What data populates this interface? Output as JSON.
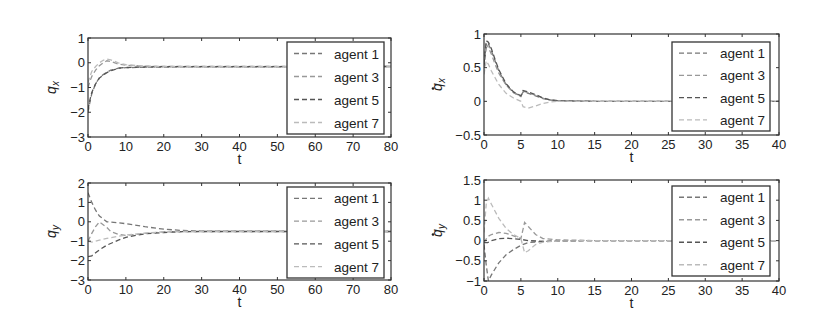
{
  "figure": {
    "background": "#ffffff",
    "axes_color": "#333333"
  },
  "chart_data": [
    {
      "id": "qx",
      "type": "line",
      "title": "",
      "xlabel": "t",
      "ylabel": "q_x",
      "ylabel_main": "q",
      "ylabel_sub": "x",
      "ylabel_dot": false,
      "xlim": [
        0,
        80
      ],
      "ylim": [
        -3,
        1
      ],
      "xticks": [
        0,
        10,
        20,
        30,
        40,
        50,
        60,
        70,
        80
      ],
      "yticks": [
        -3,
        -2,
        -1,
        0,
        1
      ],
      "grid": false,
      "legend_position": "upper right",
      "box": {
        "left": 88,
        "top": 38,
        "right": 391,
        "bottom": 137
      },
      "legend_box": {
        "left": 287,
        "top": 42,
        "right": 384,
        "bottom": 134
      },
      "series": [
        {
          "name": "agent 1",
          "color": "#777777",
          "x": [
            0,
            0.5,
            1,
            2,
            3,
            4,
            5,
            6,
            8,
            10,
            15,
            20,
            80
          ],
          "y": [
            -2.0,
            -1.6,
            -1.25,
            -0.85,
            -0.6,
            -0.48,
            -0.38,
            -0.3,
            -0.22,
            -0.2,
            -0.18,
            -0.17,
            -0.15
          ]
        },
        {
          "name": "agent 3",
          "color": "#999999",
          "x": [
            0,
            0.5,
            1,
            2,
            3,
            4,
            5,
            6,
            8,
            10,
            15,
            20,
            80
          ],
          "y": [
            -1.0,
            -0.75,
            -0.55,
            -0.3,
            -0.12,
            0.0,
            0.08,
            0.05,
            -0.05,
            -0.1,
            -0.14,
            -0.15,
            -0.15
          ]
        },
        {
          "name": "agent 5",
          "color": "#555555",
          "x": [
            0,
            0.5,
            1,
            2,
            3,
            4,
            5,
            6,
            8,
            10,
            15,
            20,
            80
          ],
          "y": [
            -1.9,
            -1.5,
            -1.2,
            -0.85,
            -0.62,
            -0.5,
            -0.4,
            -0.33,
            -0.22,
            -0.19,
            -0.17,
            -0.16,
            -0.15
          ]
        },
        {
          "name": "agent 7",
          "color": "#bbbbbb",
          "x": [
            0,
            0.5,
            1,
            2,
            3,
            4,
            5,
            6,
            8,
            10,
            15,
            20,
            80
          ],
          "y": [
            -0.8,
            -0.55,
            -0.35,
            -0.15,
            0.0,
            0.1,
            0.15,
            0.12,
            0.0,
            -0.08,
            -0.13,
            -0.15,
            -0.15
          ]
        }
      ]
    },
    {
      "id": "qx_dot",
      "type": "line",
      "title": "",
      "xlabel": "t",
      "ylabel": "q̇_x",
      "ylabel_main": "q",
      "ylabel_sub": "x",
      "ylabel_dot": true,
      "xlim": [
        0,
        40
      ],
      "ylim": [
        -0.5,
        1
      ],
      "xticks": [
        0,
        5,
        10,
        15,
        20,
        25,
        30,
        35,
        40
      ],
      "yticks": [
        -0.5,
        0,
        0.5,
        1
      ],
      "grid": false,
      "legend_position": "upper right",
      "box": {
        "left": 484,
        "top": 34,
        "right": 779,
        "bottom": 135
      },
      "legend_box": {
        "left": 672,
        "top": 42,
        "right": 770,
        "bottom": 131
      },
      "series": [
        {
          "name": "agent 1",
          "color": "#777777",
          "x": [
            0,
            0.3,
            0.6,
            1,
            1.5,
            2,
            3,
            4,
            5,
            5.3,
            6,
            7,
            8,
            9,
            10,
            12,
            15,
            40
          ],
          "y": [
            0.5,
            0.8,
            0.85,
            0.75,
            0.6,
            0.45,
            0.25,
            0.13,
            0.08,
            0.14,
            0.12,
            0.08,
            0.04,
            0.02,
            0.01,
            0.005,
            0.0,
            0.0
          ]
        },
        {
          "name": "agent 3",
          "color": "#999999",
          "x": [
            0,
            0.3,
            0.6,
            1,
            1.5,
            2,
            3,
            4,
            5,
            5.3,
            6,
            7,
            8,
            9,
            10,
            12,
            15,
            40
          ],
          "y": [
            0.6,
            0.85,
            0.8,
            0.7,
            0.55,
            0.42,
            0.24,
            0.13,
            0.07,
            0.15,
            0.13,
            0.09,
            0.05,
            0.02,
            0.01,
            0.005,
            0.0,
            0.0
          ]
        },
        {
          "name": "agent 5",
          "color": "#555555",
          "x": [
            0,
            0.3,
            0.6,
            1,
            1.5,
            2,
            3,
            4,
            5,
            5.3,
            6,
            7,
            8,
            9,
            10,
            12,
            15,
            40
          ],
          "y": [
            0.55,
            0.9,
            0.88,
            0.78,
            0.62,
            0.47,
            0.26,
            0.14,
            0.08,
            0.16,
            0.14,
            0.1,
            0.05,
            0.02,
            0.01,
            0.005,
            0.0,
            0.0
          ]
        },
        {
          "name": "agent 7",
          "color": "#bbbbbb",
          "x": [
            0,
            0.3,
            0.6,
            1,
            1.5,
            2,
            3,
            4,
            5,
            5.3,
            6,
            7,
            8,
            9,
            10,
            12,
            15,
            40
          ],
          "y": [
            0.4,
            0.6,
            0.55,
            0.45,
            0.35,
            0.25,
            0.12,
            0.05,
            0.0,
            -0.08,
            -0.1,
            -0.07,
            -0.03,
            -0.01,
            0.0,
            0.0,
            0.0,
            0.0
          ]
        }
      ]
    },
    {
      "id": "qy",
      "type": "line",
      "title": "",
      "xlabel": "t",
      "ylabel": "q_y",
      "ylabel_main": "q",
      "ylabel_sub": "y",
      "ylabel_dot": false,
      "xlim": [
        0,
        80
      ],
      "ylim": [
        -3,
        2
      ],
      "xticks": [
        0,
        10,
        20,
        30,
        40,
        50,
        60,
        70,
        80
      ],
      "yticks": [
        -3,
        -2,
        -1,
        0,
        1,
        2
      ],
      "grid": false,
      "legend_position": "upper right",
      "box": {
        "left": 88,
        "top": 183,
        "right": 391,
        "bottom": 280
      },
      "legend_box": {
        "left": 287,
        "top": 187,
        "right": 384,
        "bottom": 278
      },
      "series": [
        {
          "name": "agent 1",
          "color": "#777777",
          "x": [
            0,
            1,
            2,
            3,
            5,
            8,
            10,
            15,
            20,
            25,
            30,
            80
          ],
          "y": [
            1.5,
            1.0,
            0.6,
            0.3,
            0.0,
            -0.05,
            -0.1,
            -0.25,
            -0.38,
            -0.45,
            -0.48,
            -0.5
          ]
        },
        {
          "name": "agent 3",
          "color": "#999999",
          "x": [
            0,
            1,
            2,
            3,
            5,
            6,
            8,
            10,
            15,
            20,
            25,
            30,
            80
          ],
          "y": [
            -1.0,
            -0.6,
            -0.25,
            0.0,
            -0.3,
            -0.5,
            -0.65,
            -0.7,
            -0.6,
            -0.52,
            -0.5,
            -0.5,
            -0.5
          ]
        },
        {
          "name": "agent 5",
          "color": "#555555",
          "x": [
            0,
            1,
            2,
            3,
            5,
            8,
            10,
            15,
            20,
            25,
            30,
            80
          ],
          "y": [
            -1.8,
            -1.75,
            -1.6,
            -1.45,
            -1.2,
            -0.95,
            -0.8,
            -0.62,
            -0.55,
            -0.51,
            -0.5,
            -0.5
          ]
        },
        {
          "name": "agent 7",
          "color": "#bbbbbb",
          "x": [
            0,
            1,
            2,
            3,
            5,
            8,
            10,
            15,
            20,
            25,
            30,
            80
          ],
          "y": [
            -1.0,
            -1.05,
            -1.0,
            -0.95,
            -0.85,
            -0.75,
            -0.68,
            -0.58,
            -0.52,
            -0.5,
            -0.5,
            -0.5
          ]
        }
      ]
    },
    {
      "id": "qy_dot",
      "type": "line",
      "title": "",
      "xlabel": "t",
      "ylabel": "q̇_y",
      "ylabel_main": "q",
      "ylabel_sub": "y",
      "ylabel_dot": true,
      "xlim": [
        0,
        40
      ],
      "ylim": [
        -1,
        1.5
      ],
      "xticks": [
        0,
        5,
        10,
        15,
        20,
        25,
        30,
        35,
        40
      ],
      "yticks": [
        -1,
        -0.5,
        0,
        0.5,
        1,
        1.5
      ],
      "grid": false,
      "legend_position": "upper right",
      "box": {
        "left": 484,
        "top": 180,
        "right": 779,
        "bottom": 281
      },
      "legend_box": {
        "left": 672,
        "top": 186,
        "right": 770,
        "bottom": 276
      },
      "series": [
        {
          "name": "agent 1",
          "color": "#777777",
          "x": [
            0,
            0.3,
            0.6,
            1,
            2,
            3,
            4,
            5,
            6,
            8,
            10,
            15,
            40
          ],
          "y": [
            -0.1,
            -0.6,
            -1.0,
            -0.85,
            -0.55,
            -0.35,
            -0.22,
            -0.12,
            -0.05,
            -0.02,
            -0.01,
            0.0,
            0.0
          ]
        },
        {
          "name": "agent 3",
          "color": "#999999",
          "x": [
            0,
            0.5,
            1,
            2,
            3,
            4,
            5,
            5.5,
            6,
            7,
            8,
            10,
            15,
            40
          ],
          "y": [
            -0.05,
            0.1,
            0.15,
            0.2,
            0.18,
            0.12,
            0.05,
            0.45,
            0.35,
            0.15,
            0.05,
            0.02,
            0.0,
            0.0
          ]
        },
        {
          "name": "agent 5",
          "color": "#555555",
          "x": [
            0,
            0.5,
            1,
            2,
            3,
            4,
            5,
            6,
            8,
            10,
            15,
            40
          ],
          "y": [
            -0.05,
            -0.05,
            0.0,
            0.05,
            0.06,
            0.05,
            0.03,
            0.0,
            -0.02,
            -0.01,
            0.0,
            0.0
          ]
        },
        {
          "name": "agent 7",
          "color": "#bbbbbb",
          "x": [
            0,
            0.3,
            0.6,
            1,
            2,
            3,
            4,
            5,
            5.5,
            6,
            7,
            8,
            10,
            15,
            40
          ],
          "y": [
            0.2,
            0.9,
            1.05,
            0.9,
            0.55,
            0.3,
            0.15,
            0.05,
            -0.3,
            -0.25,
            -0.1,
            -0.04,
            -0.01,
            0.0,
            0.0
          ]
        }
      ]
    }
  ]
}
